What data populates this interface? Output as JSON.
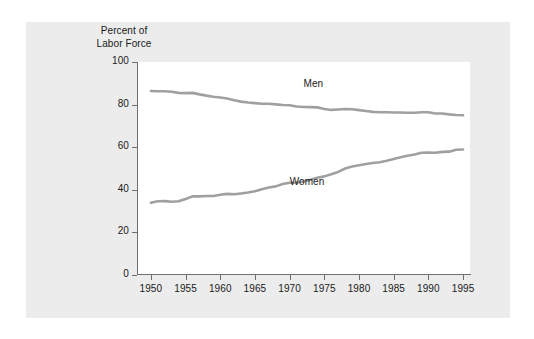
{
  "figure": {
    "background_color": "#ececec",
    "plot_background_color": "#ffffff",
    "axis_color": "#6f6f6f",
    "text_color": "#1a1a1a"
  },
  "axis_title": {
    "line1": "Percent of",
    "line2": "Labor Force"
  },
  "chart_data": {
    "type": "line",
    "title": "",
    "subtitle": "",
    "xlabel": "",
    "ylabel": "Percent of Labor Force",
    "xlim": [
      1948,
      1996
    ],
    "ylim": [
      0,
      100
    ],
    "grid": false,
    "legend_position": "inline-labels",
    "x_ticks": [
      1950,
      1955,
      1960,
      1965,
      1970,
      1975,
      1980,
      1985,
      1990,
      1995
    ],
    "y_ticks": [
      0,
      20,
      40,
      60,
      80,
      100
    ],
    "line_color": "#a0a0a0",
    "line_width": 2.6,
    "x": [
      1950,
      1951,
      1952,
      1953,
      1954,
      1955,
      1956,
      1957,
      1958,
      1959,
      1960,
      1961,
      1962,
      1963,
      1964,
      1965,
      1966,
      1967,
      1968,
      1969,
      1970,
      1971,
      1972,
      1973,
      1974,
      1975,
      1976,
      1977,
      1978,
      1979,
      1980,
      1981,
      1982,
      1983,
      1984,
      1985,
      1986,
      1987,
      1988,
      1989,
      1990,
      1991,
      1992,
      1993,
      1994,
      1995
    ],
    "series": [
      {
        "name": "Men",
        "label": "Men",
        "label_x": 1972,
        "label_y": 89,
        "values": [
          86.4,
          86.3,
          86.3,
          86.0,
          85.5,
          85.4,
          85.5,
          84.8,
          84.2,
          83.7,
          83.3,
          82.9,
          82.0,
          81.4,
          81.0,
          80.7,
          80.4,
          80.4,
          80.1,
          79.8,
          79.7,
          79.1,
          78.9,
          78.8,
          78.7,
          77.9,
          77.5,
          77.7,
          77.9,
          77.8,
          77.4,
          77.0,
          76.6,
          76.4,
          76.4,
          76.3,
          76.3,
          76.2,
          76.2,
          76.4,
          76.4,
          75.8,
          75.8,
          75.4,
          75.1,
          75.0
        ]
      },
      {
        "name": "Women",
        "label": "Women",
        "label_x": 1970,
        "label_y": 43,
        "values": [
          33.9,
          34.6,
          34.7,
          34.4,
          34.6,
          35.7,
          36.9,
          36.9,
          37.1,
          37.1,
          37.7,
          38.1,
          37.9,
          38.3,
          38.7,
          39.3,
          40.3,
          41.1,
          41.6,
          42.7,
          43.3,
          43.4,
          43.9,
          44.7,
          45.7,
          46.3,
          47.3,
          48.4,
          50.0,
          50.9,
          51.5,
          52.1,
          52.6,
          52.9,
          53.6,
          54.5,
          55.3,
          56.0,
          56.6,
          57.4,
          57.5,
          57.4,
          57.8,
          57.9,
          58.8,
          58.9
        ]
      }
    ]
  }
}
